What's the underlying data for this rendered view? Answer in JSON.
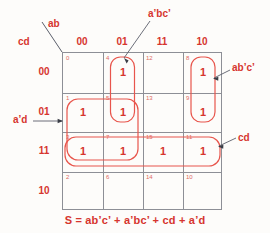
{
  "axis": {
    "column_var": "ab",
    "row_var": "cd",
    "column_headers": [
      "00",
      "01",
      "11",
      "10"
    ],
    "row_headers": [
      "00",
      "01",
      "11",
      "10"
    ]
  },
  "cells": [
    {
      "minterm": "0",
      "value": "",
      "row": 0,
      "col": 0
    },
    {
      "minterm": "4",
      "value": "1",
      "row": 0,
      "col": 1
    },
    {
      "minterm": "12",
      "value": "",
      "row": 0,
      "col": 2
    },
    {
      "minterm": "8",
      "value": "1",
      "row": 0,
      "col": 3
    },
    {
      "minterm": "1",
      "value": "1",
      "row": 1,
      "col": 0
    },
    {
      "minterm": "5",
      "value": "1",
      "row": 1,
      "col": 1
    },
    {
      "minterm": "13",
      "value": "",
      "row": 1,
      "col": 2
    },
    {
      "minterm": "9",
      "value": "1",
      "row": 1,
      "col": 3
    },
    {
      "minterm": "3",
      "value": "1",
      "row": 2,
      "col": 0
    },
    {
      "minterm": "7",
      "value": "1",
      "row": 2,
      "col": 1
    },
    {
      "minterm": "15",
      "value": "1",
      "row": 2,
      "col": 2
    },
    {
      "minterm": "11",
      "value": "1",
      "row": 2,
      "col": 3
    },
    {
      "minterm": "2",
      "value": "",
      "row": 3,
      "col": 0
    },
    {
      "minterm": "6",
      "value": "",
      "row": 3,
      "col": 1
    },
    {
      "minterm": "14",
      "value": "",
      "row": 3,
      "col": 2
    },
    {
      "minterm": "10",
      "value": "",
      "row": 3,
      "col": 3
    }
  ],
  "groups": [
    {
      "id": "group-a-prime-b-c-prime",
      "label": "a’bc’",
      "minterms": [
        "4",
        "5"
      ]
    },
    {
      "id": "group-a-b-prime-c-prime",
      "label": "ab’c’",
      "minterms": [
        "8",
        "9"
      ]
    },
    {
      "id": "group-cd",
      "label": "cd",
      "minterms": [
        "3",
        "7",
        "15",
        "11"
      ]
    },
    {
      "id": "group-a-prime-d",
      "label": "a’d",
      "minterms": [
        "1",
        "5",
        "3",
        "7"
      ]
    }
  ],
  "equation": "S = ab’c’ + a’bc’ + cd + a’d",
  "colors": {
    "accent": "#d6352e",
    "grid_line": "#8d8f96",
    "minterm": "#e06a63",
    "background": "#fdfcfa",
    "leader_line": "#5b5f6b"
  }
}
